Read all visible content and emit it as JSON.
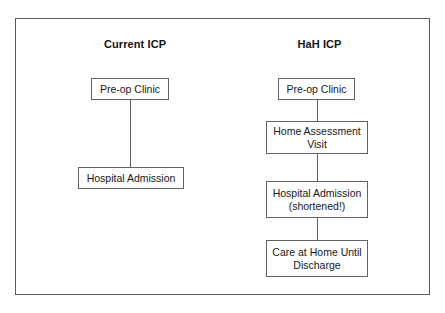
{
  "figure": {
    "background_color": "#ffffff",
    "frame_color": "#555b60",
    "box_border_color": "#5d6368",
    "text_color": "#15181b",
    "connector_color": "#5d6368"
  },
  "columns": [
    {
      "id": "current",
      "title": "Current ICP",
      "nodes": [
        {
          "id": "current-preop",
          "line1": "Pre-op Clinic",
          "line2": ""
        },
        {
          "id": "current-admit",
          "line1": "Hospital Admission",
          "line2": ""
        }
      ]
    },
    {
      "id": "hah",
      "title": "HaH ICP",
      "nodes": [
        {
          "id": "hah-preop",
          "line1": "Pre-op Clinic",
          "line2": ""
        },
        {
          "id": "hah-home",
          "line1": "Home Assessment",
          "line2": "Visit"
        },
        {
          "id": "hah-admit",
          "line1": "Hospital Admission",
          "line2": "(shortened!)"
        },
        {
          "id": "hah-care",
          "line1": "Care at Home Until",
          "line2": "Discharge"
        }
      ]
    }
  ]
}
